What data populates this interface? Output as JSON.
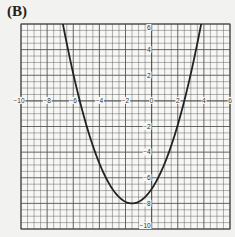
{
  "panel_label": "(B)",
  "chart_data": {
    "type": "line",
    "title": "",
    "xlabel": "",
    "ylabel": "",
    "xlim": [
      -10,
      6
    ],
    "ylim": [
      -10,
      6
    ],
    "grid": true,
    "minor_grid_step": 0.5,
    "major_grid_step": 2,
    "x_tick_labels": [
      "-10",
      "-8",
      "-6",
      "-4",
      "-2",
      "0",
      "2",
      "4",
      "6"
    ],
    "y_tick_labels": [
      "6",
      "4",
      "2",
      "-2",
      "-4",
      "-6",
      "-8",
      "-10"
    ],
    "series": [
      {
        "name": "parabola",
        "equation": "y = 0.5(x + 1.5)^2 - 8",
        "vertex": [
          -1.5,
          -8
        ],
        "x_intercepts": [
          -5.5,
          2.5
        ],
        "y_intercept": -6.875,
        "x": [
          -6.8,
          -6,
          -5.5,
          -5,
          -4,
          -3,
          -2,
          -1.5,
          -1,
          0,
          1,
          2,
          2.5,
          3,
          3.8
        ],
        "y": [
          6.05,
          2.13,
          0,
          -1.88,
          -4.88,
          -6.88,
          -7.88,
          -8,
          -7.88,
          -6.88,
          -4.88,
          -1.88,
          0,
          2.13,
          6.05
        ]
      }
    ],
    "line_color": "#222222",
    "grid_color": "#555555"
  }
}
